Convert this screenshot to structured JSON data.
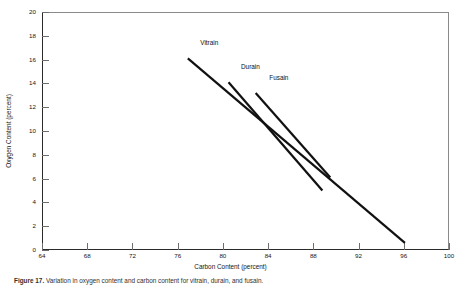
{
  "figure": {
    "caption_number": "Figure 17.",
    "caption_text": "Variation in oxygen content and carbon content for vitrain, durain, and fusain."
  },
  "chart_data": {
    "type": "line",
    "title": "",
    "xlabel": "Carbon Content (percent)",
    "ylabel": "Oxygen Content (percent)",
    "xlim": [
      64,
      100
    ],
    "ylim": [
      0,
      20
    ],
    "xticks": [
      64,
      68,
      72,
      76,
      80,
      84,
      88,
      92,
      96,
      100
    ],
    "yticks": [
      0,
      2,
      4,
      6,
      8,
      10,
      12,
      14,
      16,
      18,
      20
    ],
    "grid": false,
    "legend": "inline-labels",
    "line_color": "#111111",
    "series": [
      {
        "name": "Vitrain",
        "x": [
          76.9,
          96.1
        ],
        "y": [
          16.1,
          0.6
        ],
        "label_x": 78.0,
        "label_y": 17.3
      },
      {
        "name": "Durain",
        "x": [
          80.5,
          88.8
        ],
        "y": [
          14.1,
          5.0
        ],
        "label_x": 81.6,
        "label_y": 15.3
      },
      {
        "name": "Fusain",
        "x": [
          82.9,
          89.5
        ],
        "y": [
          13.2,
          6.1
        ],
        "label_x": 84.1,
        "label_y": 14.4
      }
    ]
  }
}
